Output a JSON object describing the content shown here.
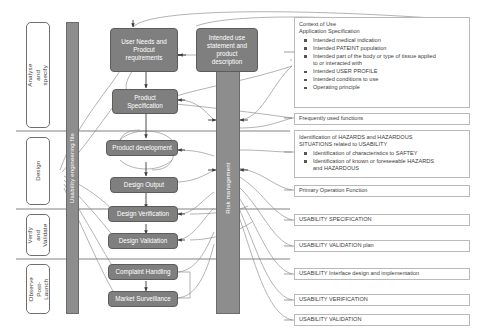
{
  "diagram": {
    "colors": {
      "process_box_fill": "#7f7f7f",
      "process_box_text": "#ffffff",
      "bar_fill": "#8d8d8d",
      "info_box_border": "#b9b9b9",
      "connector": "#777777",
      "divider": "#4a4a4a"
    }
  },
  "phases": [
    {
      "label": "Analyse and specify"
    },
    {
      "label": "Design"
    },
    {
      "label": "Verify and\nValidate"
    },
    {
      "label": "Observe\nPost-Launch"
    }
  ],
  "bars": [
    {
      "name": "usability-engineering-file-bar",
      "label": "Usability engineering file"
    },
    {
      "name": "risk-management-bar",
      "label": "Risk management"
    }
  ],
  "process_boxes": [
    {
      "id": "user-needs",
      "label": "User Needs and\nProdcut\nrequirements"
    },
    {
      "id": "intended-use",
      "label": "Intended use\nstatement and\nproduct\ndescription"
    },
    {
      "id": "product-specification",
      "label": "Product\nSpecification"
    },
    {
      "id": "product-development",
      "label": "Product development"
    },
    {
      "id": "design-output",
      "label": "Design Output"
    },
    {
      "id": "design-verification",
      "label": "Design Verification"
    },
    {
      "id": "design-validation",
      "label": "Design Validation"
    },
    {
      "id": "complaint-handling",
      "label": "Complaint Handling"
    },
    {
      "id": "market-surveillance",
      "label": "Market Surveillance"
    }
  ],
  "info_boxes": [
    {
      "id": "context-of-use",
      "title": "Context of Use\nApplication Specification",
      "items": [
        "Intended medical indication",
        "Intended PATEINT population",
        "Intended part of the body or type of tissue applied\nto or interacted with",
        "Intended USER PROFILE",
        "Intended conditions to use",
        "Operating principle"
      ]
    },
    {
      "id": "frequently-used-functions",
      "title": "Frequently used functions",
      "items": []
    },
    {
      "id": "hazards-identification",
      "title": "Identification of HAZARDS and HAZARDOUS\nSITUATIONS related to USABILITY",
      "items": [
        "Identification of characteristics to SAFTEY",
        "Identification of known or foreseeable HAZARDS\nand HAZARDOUS"
      ]
    },
    {
      "id": "primary-operation-function",
      "title": "Primary Operation Function",
      "items": []
    },
    {
      "id": "usability-specification",
      "title": "USABILITY SPECIFICATION",
      "items": []
    },
    {
      "id": "usability-validation-plan",
      "title": "USABILITY VALIDATION plan",
      "items": []
    },
    {
      "id": "usability-interface-design",
      "title": "USABILITY Interface design and implementation",
      "items": []
    },
    {
      "id": "usability-verification",
      "title": "USABILITY VERIFICATION",
      "items": []
    },
    {
      "id": "usability-validation",
      "title": "USABILITY VALIDATION",
      "items": []
    }
  ]
}
